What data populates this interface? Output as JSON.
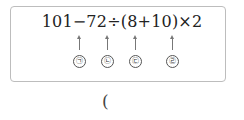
{
  "problem": {
    "expression": "101−72÷(8+10)×2",
    "markers": [
      {
        "label": "㉠",
        "x": 79
      },
      {
        "label": "㉡",
        "x": 107
      },
      {
        "label": "㉢",
        "x": 135
      },
      {
        "label": "㉣",
        "x": 172
      }
    ],
    "answer_open_paren": "("
  }
}
